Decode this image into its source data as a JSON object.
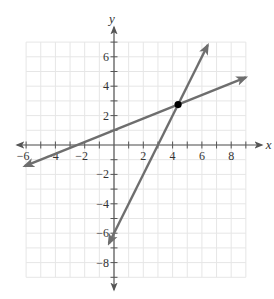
{
  "chart_data": {
    "type": "line",
    "title": "",
    "xlabel": "x",
    "ylabel": "y",
    "xlim": [
      -6.2,
      9.4
    ],
    "ylim": [
      -9.3,
      7.6
    ],
    "grid": true,
    "grid_range": {
      "x": [
        -6,
        9
      ],
      "y": [
        -9,
        7
      ]
    },
    "x_ticks": [
      -6,
      -4,
      -2,
      2,
      4,
      6,
      8
    ],
    "x_tick_labels": [
      "−6",
      "−4",
      "−2",
      "2",
      "4",
      "6",
      "8"
    ],
    "y_ticks": [
      6,
      4,
      2,
      -2,
      -4,
      -6,
      -8
    ],
    "y_tick_labels": [
      "6",
      "4",
      "2",
      "−2",
      "−4",
      "−6",
      "−8"
    ],
    "series": [
      {
        "name": "line-1",
        "equation": "y = 0.4x + 1",
        "slope": 0.4,
        "intercept": 1,
        "x": [
          -6.1,
          9.0
        ],
        "y": [
          -1.44,
          4.6
        ]
      },
      {
        "name": "line-2",
        "equation": "y = 2x - 6",
        "slope": 2,
        "intercept": -6,
        "x": [
          -0.35,
          6.4
        ],
        "y": [
          -6.7,
          6.8
        ]
      }
    ],
    "points": [
      {
        "name": "intersection",
        "x": 4.375,
        "y": 2.75
      }
    ]
  },
  "colors": {
    "line": "#6e6e6e",
    "axis": "#555555",
    "grid": "#e6e6e6",
    "point": "#000000"
  }
}
